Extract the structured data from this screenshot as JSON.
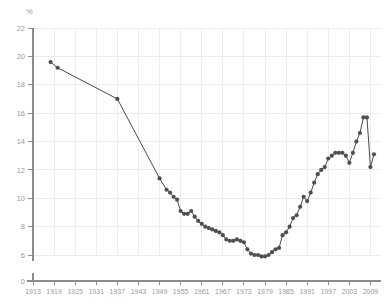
{
  "chart_data": {
    "type": "line",
    "title": "",
    "xlabel": "",
    "ylabel": "%",
    "ylim": [
      6,
      22
    ],
    "xlim": [
      1913,
      2012
    ],
    "grid": true,
    "legend_position": "none",
    "y_axis_break": true,
    "y_break_labels": [
      "0",
      "6"
    ],
    "ytick_labels": [
      "22",
      "20",
      "18",
      "16",
      "14",
      "12",
      "10",
      "8",
      "6",
      "0"
    ],
    "ytick_values": [
      22,
      20,
      18,
      16,
      14,
      12,
      10,
      8,
      6,
      0
    ],
    "xtick_labels": [
      "1913",
      "1919",
      "1925",
      "1931",
      "1937",
      "1943",
      "1949",
      "1955",
      "1961",
      "1967",
      "1973",
      "1979",
      "1985",
      "1991",
      "1997",
      "2003",
      "2009"
    ],
    "xtick_values": [
      1913,
      1919,
      1925,
      1931,
      1937,
      1943,
      1949,
      1955,
      1961,
      1967,
      1973,
      1979,
      1985,
      1991,
      1997,
      2003,
      2009
    ],
    "marker": "circle",
    "marker_color": "#4f4f4f",
    "line_color": "#4a4a4a",
    "series": [
      {
        "name": "Share of total (%)",
        "x": [
          1918,
          1920,
          1937,
          1949,
          1951,
          1952,
          1953,
          1954,
          1955,
          1956,
          1957,
          1958,
          1959,
          1960,
          1961,
          1962,
          1963,
          1964,
          1965,
          1966,
          1967,
          1968,
          1969,
          1970,
          1971,
          1972,
          1973,
          1974,
          1975,
          1976,
          1977,
          1978,
          1979,
          1980,
          1981,
          1982,
          1983,
          1984,
          1985,
          1986,
          1987,
          1988,
          1989,
          1990,
          1991,
          1992,
          1993,
          1994,
          1995,
          1996,
          1997,
          1998,
          1999,
          2000,
          2001,
          2002,
          2003,
          2004,
          2005,
          2006,
          2007,
          2008,
          2009,
          2010
        ],
        "y": [
          19.6,
          19.2,
          17.0,
          11.4,
          10.6,
          10.4,
          10.1,
          9.9,
          9.1,
          8.9,
          8.9,
          9.1,
          8.7,
          8.4,
          8.2,
          8.0,
          7.9,
          7.8,
          7.7,
          7.6,
          7.4,
          7.1,
          7.0,
          7.0,
          7.1,
          7.0,
          6.9,
          6.4,
          6.1,
          6.0,
          6.0,
          5.9,
          5.9,
          6.0,
          6.2,
          6.4,
          6.5,
          7.4,
          7.6,
          8.0,
          8.6,
          8.8,
          9.4,
          10.1,
          9.8,
          10.4,
          11.1,
          11.7,
          12.0,
          12.2,
          12.8,
          13.0,
          13.2,
          13.2,
          13.2,
          13.0,
          12.5,
          13.2,
          14.0,
          14.6,
          15.7,
          15.7,
          12.2,
          13.1
        ]
      }
    ]
  },
  "axis": {
    "y_unit": "%"
  }
}
